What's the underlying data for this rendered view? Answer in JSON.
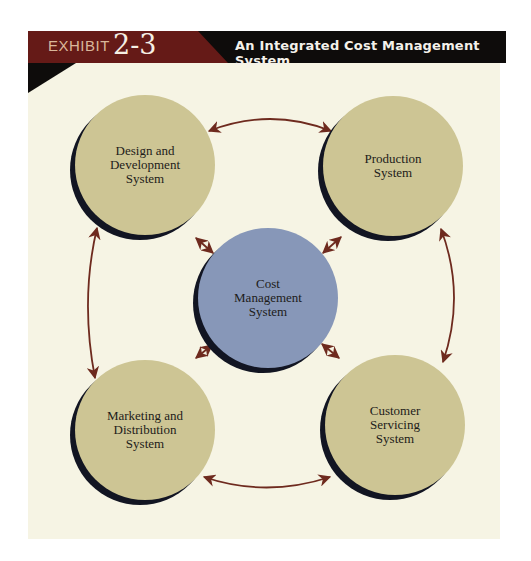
{
  "header": {
    "exhibit_label": "EXHIBIT",
    "exhibit_number": "2-3",
    "title": "An Integrated Cost Management System"
  },
  "colors": {
    "header_red": "#651a17",
    "header_black": "#0e0c0b",
    "background": "#f6f4e4",
    "node_fill": "#cdc594",
    "center_fill": "#8797b8",
    "shadow": "#121522",
    "arrow": "#6e2a1e"
  },
  "nodes": [
    {
      "id": "design",
      "lines": [
        "Design and",
        "Development",
        "System"
      ],
      "type": "outer"
    },
    {
      "id": "production",
      "lines": [
        "Production",
        "System"
      ],
      "type": "outer"
    },
    {
      "id": "cost",
      "lines": [
        "Cost",
        "Management",
        "System"
      ],
      "type": "center"
    },
    {
      "id": "marketing",
      "lines": [
        "Marketing and",
        "Distribution",
        "System"
      ],
      "type": "outer"
    },
    {
      "id": "customer",
      "lines": [
        "Customer",
        "Servicing",
        "System"
      ],
      "type": "outer"
    }
  ],
  "connections": [
    {
      "from": "design",
      "to": "production",
      "direction": "both"
    },
    {
      "from": "production",
      "to": "customer",
      "direction": "both"
    },
    {
      "from": "customer",
      "to": "marketing",
      "direction": "both"
    },
    {
      "from": "marketing",
      "to": "design",
      "direction": "both"
    },
    {
      "from": "cost",
      "to": "design",
      "direction": "both"
    },
    {
      "from": "cost",
      "to": "production",
      "direction": "both"
    },
    {
      "from": "cost",
      "to": "marketing",
      "direction": "both"
    },
    {
      "from": "cost",
      "to": "customer",
      "direction": "both"
    }
  ]
}
